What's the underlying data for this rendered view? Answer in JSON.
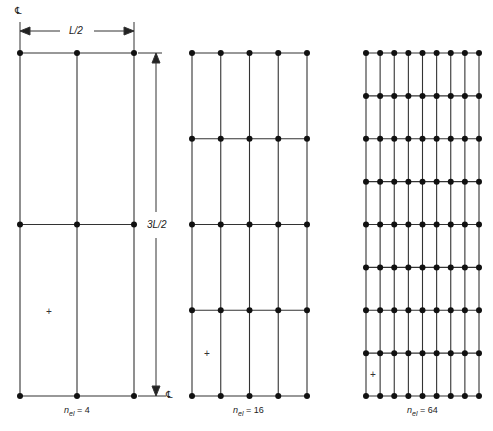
{
  "figure": {
    "dimensions": {
      "width_label": "L/2",
      "height_label": "3L/2",
      "centerline_symbol": "℄"
    },
    "meshes": [
      {
        "id": "mesh-4",
        "caption_var": "n",
        "caption_sub": "el",
        "caption_eq": " = 4",
        "columns": 2,
        "rows": 2,
        "x0": 20,
        "x1": 134,
        "y0": 53,
        "y1": 396,
        "marker": {
          "x": 49,
          "y": 312,
          "symbol": "+"
        }
      },
      {
        "id": "mesh-16",
        "caption_var": "n",
        "caption_sub": "el",
        "caption_eq": " = 16",
        "columns": 4,
        "rows": 4,
        "x0": 192,
        "x1": 307,
        "y0": 53,
        "y1": 396,
        "marker": {
          "x": 207,
          "y": 354,
          "symbol": "+"
        }
      },
      {
        "id": "mesh-64",
        "caption_var": "n",
        "caption_sub": "el",
        "caption_eq": " = 64",
        "columns": 8,
        "rows": 8,
        "x0": 366,
        "x1": 479,
        "y0": 53,
        "y1": 396,
        "marker": {
          "x": 373,
          "y": 375,
          "symbol": "+"
        }
      }
    ],
    "colors": {
      "line": "#333333",
      "node": "#111111",
      "background": "#ffffff"
    }
  }
}
